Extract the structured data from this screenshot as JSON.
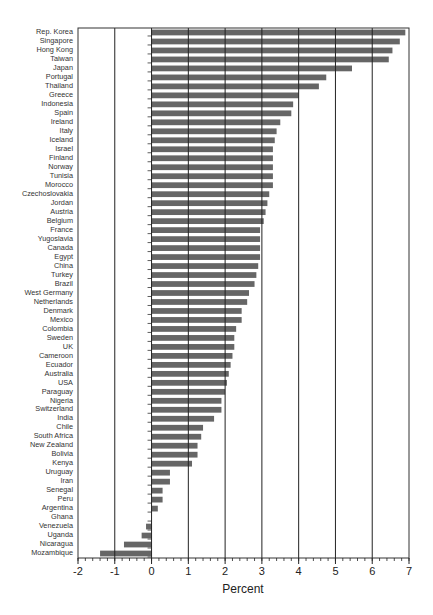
{
  "chart_data": {
    "type": "bar",
    "orientation": "horizontal",
    "title": "",
    "xlabel": "Percent",
    "ylabel": "",
    "xlim": [
      -2,
      7
    ],
    "xticks": [
      -2,
      -1,
      0,
      1,
      2,
      3,
      4,
      5,
      6,
      7
    ],
    "xtick_labels": [
      "-2",
      "-1",
      "0",
      "1",
      "2",
      "3",
      "4",
      "5",
      "6",
      "7"
    ],
    "minor_tick_step": 0.2,
    "grid": "vertical lines at integer x values",
    "legend": null,
    "bar_color": "#666666",
    "categories": [
      "Rep. Korea",
      "Singapore",
      "Hong Kong",
      "Taiwan",
      "Japan",
      "Portugal",
      "Thailand",
      "Greece",
      "Indonesia",
      "Spain",
      "Ireland",
      "Italy",
      "Iceland",
      "Israel",
      "Finland",
      "Norway",
      "Tunisia",
      "Morocco",
      "Czechoslovakia",
      "Jordan",
      "Austria",
      "Belgium",
      "France",
      "Yugoslavia",
      "Canada",
      "Egypt",
      "China",
      "Turkey",
      "Brazil",
      "West Germany",
      "Netherlands",
      "Denmark",
      "Mexico",
      "Colombia",
      "Sweden",
      "UK",
      "Cameroon",
      "Ecuador",
      "Australia",
      "USA",
      "Paraguay",
      "Nigeria",
      "Switzerland",
      "India",
      "Chile",
      "South Africa",
      "New Zealand",
      "Bolivia",
      "Kenya",
      "Uruguay",
      "Iran",
      "Senegal",
      "Peru",
      "Argentina",
      "Ghana",
      "Venezuela",
      "Uganda",
      "Nicaragua",
      "Mozambique"
    ],
    "values": [
      6.9,
      6.75,
      6.55,
      6.45,
      5.45,
      4.75,
      4.55,
      4.0,
      3.85,
      3.8,
      3.5,
      3.4,
      3.35,
      3.3,
      3.3,
      3.3,
      3.3,
      3.3,
      3.2,
      3.15,
      3.1,
      3.05,
      2.95,
      2.95,
      2.95,
      2.95,
      2.9,
      2.85,
      2.8,
      2.65,
      2.6,
      2.45,
      2.45,
      2.3,
      2.25,
      2.25,
      2.2,
      2.15,
      2.1,
      2.05,
      2.0,
      1.9,
      1.9,
      1.7,
      1.4,
      1.35,
      1.25,
      1.25,
      1.1,
      0.5,
      0.5,
      0.3,
      0.3,
      0.17,
      0.0,
      -0.15,
      -0.27,
      -0.75,
      -1.4
    ]
  }
}
